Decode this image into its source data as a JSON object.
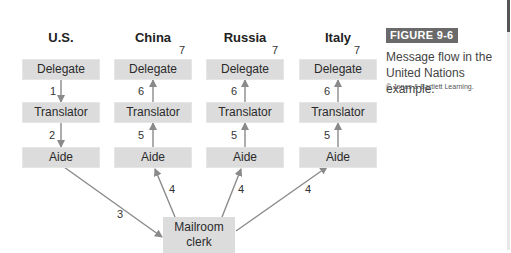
{
  "diagram": {
    "columns": [
      {
        "title": "U.S.",
        "delegate": "Delegate",
        "translator": "Translator",
        "aide": "Aide",
        "label_del_tr": "1",
        "label_tr_aide": "2",
        "label_top": ""
      },
      {
        "title": "China",
        "delegate": "Delegate",
        "translator": "Translator",
        "aide": "Aide",
        "label_del_tr": "6",
        "label_tr_aide": "5",
        "label_top": "7"
      },
      {
        "title": "Russia",
        "delegate": "Delegate",
        "translator": "Translator",
        "aide": "Aide",
        "label_del_tr": "6",
        "label_tr_aide": "5",
        "label_top": "7"
      },
      {
        "title": "Italy",
        "delegate": "Delegate",
        "translator": "Translator",
        "aide": "Aide",
        "label_del_tr": "6",
        "label_tr_aide": "5",
        "label_top": "7"
      }
    ],
    "mailroom": {
      "line1": "Mailroom",
      "line2": "clerk"
    },
    "edge_labels": {
      "us_to_mail": "3",
      "mail_to_china": "4",
      "mail_to_russia": "4",
      "mail_to_italy": "4"
    },
    "colors": {
      "box": "#dcdcdc",
      "arrow": "#8a8a8a",
      "badge": "#6a6a6a"
    }
  },
  "figure": {
    "badge": "FIGURE 9-6",
    "caption_line1": "Message flow in the",
    "caption_line2": "United Nations example.",
    "copyright": "© Jones & Bartlett Learning."
  }
}
